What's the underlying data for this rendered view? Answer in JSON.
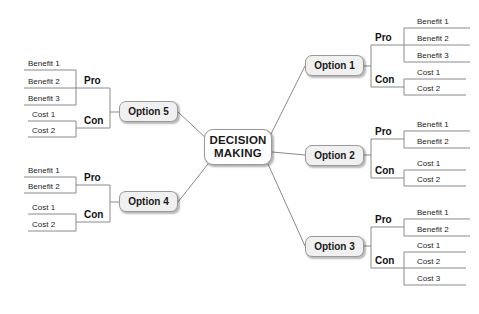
{
  "diagram": {
    "type": "mind-map",
    "center": {
      "label_line1": "DECISION",
      "label_line2": "MAKING"
    },
    "colors": {
      "background": "#ffffff",
      "center_fill": "#ffffff",
      "option_fill": "#f0f0f0",
      "border": "#9a9a9a",
      "line": "#8a8a8a",
      "text": "#1a1a1a"
    },
    "branches": [
      {
        "option": "Option 1",
        "side": "right",
        "pro": {
          "label": "Pro",
          "items": [
            "Benefit 1",
            "Benefit 2",
            "Benefit 3"
          ]
        },
        "con": {
          "label": "Con",
          "items": [
            "Cost 1",
            "Cost 2"
          ]
        }
      },
      {
        "option": "Option 2",
        "side": "right",
        "pro": {
          "label": "Pro",
          "items": [
            "Benefit 1",
            "Benefit 2"
          ]
        },
        "con": {
          "label": "Con",
          "items": [
            "Cost 1",
            "Cost 2"
          ]
        }
      },
      {
        "option": "Option 3",
        "side": "right",
        "pro": {
          "label": "Pro",
          "items": [
            "Benefit 1",
            "Benefit 2"
          ]
        },
        "con": {
          "label": "Con",
          "items": [
            "Cost 1",
            "Cost 2",
            "Cost 3"
          ]
        }
      },
      {
        "option": "Option 5",
        "side": "left",
        "pro": {
          "label": "Pro",
          "items": [
            "Benefit 1",
            "Benefit 2",
            "Benefit 3"
          ]
        },
        "con": {
          "label": "Con",
          "items": [
            "Cost 1",
            "Cost 2"
          ]
        }
      },
      {
        "option": "Option 4",
        "side": "left",
        "pro": {
          "label": "Pro",
          "items": [
            "Benefit 1",
            "Benefit 2"
          ]
        },
        "con": {
          "label": "Con",
          "items": [
            "Cost 1",
            "Cost 2"
          ]
        }
      }
    ]
  }
}
